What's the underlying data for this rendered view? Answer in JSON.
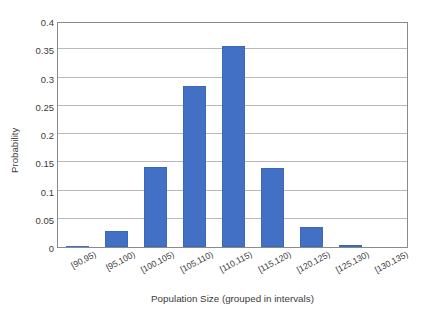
{
  "chart_data": {
    "type": "bar",
    "title": "",
    "xlabel": "Population Size (grouped in intervals)",
    "ylabel": "Probability",
    "categories": [
      "[90,95)",
      "[95,100)",
      "[100,105)",
      "[105,110)",
      "[110,115)",
      "[115,120)",
      "[120,125)",
      "[125,130)",
      "[130,135)"
    ],
    "values": [
      0.002,
      0.029,
      0.142,
      0.285,
      0.355,
      0.14,
      0.036,
      0.003,
      0.0
    ],
    "series": [
      {
        "name": "Probability",
        "values": [
          0.002,
          0.029,
          0.142,
          0.285,
          0.355,
          0.14,
          0.036,
          0.003,
          0.0
        ]
      }
    ],
    "ylim": [
      0,
      0.4
    ],
    "ytick_labels": [
      "0",
      "0.05",
      "0.1",
      "0.15",
      "0.2",
      "0.25",
      "0.3",
      "0.35",
      "0.4"
    ],
    "ytick_values": [
      0,
      0.05,
      0.1,
      0.15,
      0.2,
      0.25,
      0.3,
      0.35,
      0.4
    ],
    "grid": "horizontal",
    "legend": "none",
    "bar_color": "#4170c4",
    "gridline_color": "#b9b9b9",
    "axis_color": "#8a8a8a",
    "background": "#ffffff"
  }
}
